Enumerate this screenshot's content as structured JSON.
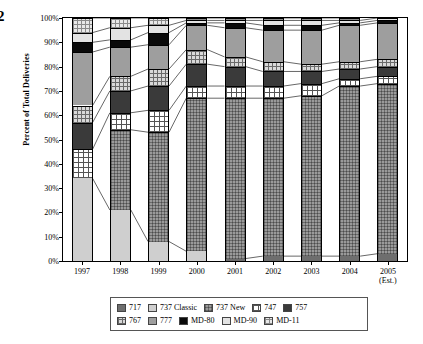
{
  "page_number": "2",
  "chart_data": {
    "type": "bar",
    "stacked": true,
    "title": "",
    "xlabel": "",
    "ylabel": "Percent of Total Deliveries",
    "ylim": [
      0,
      100
    ],
    "ytick_labels": [
      "0%",
      "10%",
      "20%",
      "30%",
      "40%",
      "50%",
      "60%",
      "70%",
      "80%",
      "90%",
      "100%"
    ],
    "ytick_values": [
      0,
      10,
      20,
      30,
      40,
      50,
      60,
      70,
      80,
      90,
      100
    ],
    "grid": false,
    "legend_position": "bottom",
    "categories": [
      "1997",
      "1998",
      "1999",
      "2000",
      "2001",
      "2002",
      "2003",
      "2004",
      "2005"
    ],
    "category_sublabels": [
      "",
      "",
      "",
      "",
      "",
      "",
      "",
      "",
      "(Est.)"
    ],
    "series": [
      {
        "name": "717",
        "swatch": "p-717",
        "values": [
          0,
          0,
          0,
          0,
          1,
          2,
          2,
          2,
          3
        ]
      },
      {
        "name": "737 Classic",
        "swatch": "p-737c",
        "values": [
          34,
          21,
          8,
          4,
          0,
          0,
          0,
          0,
          0
        ]
      },
      {
        "name": "737 New",
        "swatch": "p-737n",
        "values": [
          0,
          33,
          45,
          63,
          66,
          65,
          66,
          70,
          70
        ]
      },
      {
        "name": "747",
        "swatch": "p-747",
        "values": [
          12,
          7,
          9,
          5,
          5,
          5,
          5,
          3,
          3
        ]
      },
      {
        "name": "757",
        "swatch": "p-757",
        "values": [
          11,
          9,
          10,
          9,
          8,
          6,
          5,
          4,
          4
        ]
      },
      {
        "name": "767",
        "swatch": "p-767",
        "values": [
          7,
          6,
          7,
          6,
          4,
          4,
          3,
          3,
          3
        ]
      },
      {
        "name": "777",
        "swatch": "p-777",
        "values": [
          22,
          12,
          10,
          10,
          12,
          13,
          14,
          15,
          15
        ]
      },
      {
        "name": "MD-80",
        "swatch": "p-md80",
        "values": [
          4,
          3,
          5,
          1,
          2,
          2,
          2,
          1,
          1
        ]
      },
      {
        "name": "MD-90",
        "swatch": "p-md90",
        "values": [
          4,
          5,
          3,
          1,
          1,
          2,
          2,
          1,
          1
        ]
      },
      {
        "name": "MD-11",
        "swatch": "p-md11",
        "values": [
          6,
          4,
          3,
          1,
          1,
          1,
          1,
          1,
          0
        ]
      }
    ]
  },
  "legend": {
    "row1": [
      {
        "label": "717",
        "swatch": "p-717"
      },
      {
        "label": "737 Classic",
        "swatch": "p-737c"
      },
      {
        "label": "737 New",
        "swatch": "p-737n"
      },
      {
        "label": "747",
        "swatch": "p-747"
      },
      {
        "label": "757",
        "swatch": "p-757"
      }
    ],
    "row2": [
      {
        "label": "767",
        "swatch": "p-767"
      },
      {
        "label": "777",
        "swatch": "p-777"
      },
      {
        "label": "MD-80",
        "swatch": "p-md80"
      },
      {
        "label": "MD-90",
        "swatch": "p-md90"
      },
      {
        "label": "MD-11",
        "swatch": "p-md11"
      }
    ]
  }
}
